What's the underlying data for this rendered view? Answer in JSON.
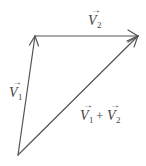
{
  "diagram": {
    "colors": {
      "stroke": "#555555",
      "text": "#444444",
      "background": "#ffffff"
    },
    "points": {
      "origin": [
        18,
        155
      ],
      "v1_tip": [
        35,
        36
      ],
      "sum_tip": [
        138,
        36
      ]
    },
    "vectors": [
      {
        "id": "v1",
        "base": "V",
        "subscript": "1",
        "from": "origin",
        "to": "v1_tip"
      },
      {
        "id": "v2",
        "base": "V",
        "subscript": "2",
        "from": "v1_tip",
        "to": "sum_tip"
      },
      {
        "id": "sum",
        "from": "origin",
        "to": "sum_tip"
      }
    ],
    "labels": {
      "v1": {
        "base": "V",
        "sub": "1",
        "arrow": "→"
      },
      "v2": {
        "base": "V",
        "sub": "2",
        "arrow": "→"
      },
      "sum": {
        "a_base": "V",
        "a_sub": "1",
        "op": "+",
        "b_base": "V",
        "b_sub": "2",
        "arrow": "→"
      }
    }
  }
}
